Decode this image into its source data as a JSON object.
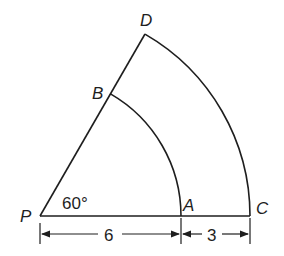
{
  "diagram": {
    "type": "annular-sector",
    "points": {
      "P": {
        "label": "P"
      },
      "A": {
        "label": "A"
      },
      "B": {
        "label": "B"
      },
      "C": {
        "label": "C"
      },
      "D": {
        "label": "D"
      }
    },
    "angle_label": "60°",
    "dimensions": {
      "PA": "6",
      "AC": "3"
    },
    "stroke_color": "#1e1e1e",
    "background": "#ffffff"
  }
}
